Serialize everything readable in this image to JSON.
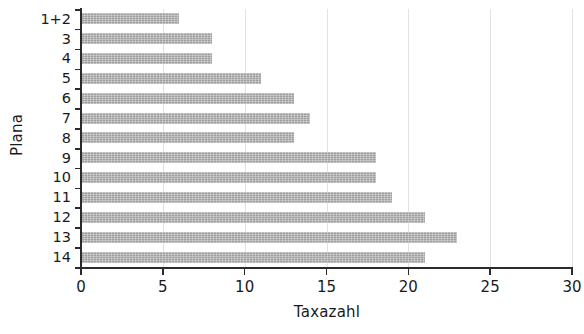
{
  "chart_data": {
    "type": "bar",
    "orientation": "horizontal",
    "title": "",
    "xlabel": "Taxazahl",
    "ylabel": "Plana",
    "categories": [
      "1+2",
      "3",
      "4",
      "5",
      "6",
      "7",
      "8",
      "9",
      "10",
      "11",
      "12",
      "13",
      "14"
    ],
    "values": [
      6,
      8,
      8,
      11,
      13,
      14,
      13,
      18,
      18,
      19,
      21,
      23,
      21
    ],
    "xlim": [
      0,
      30
    ],
    "xticks": [
      0,
      5,
      10,
      15,
      20,
      25,
      30
    ],
    "xtick_labels": [
      "0",
      "5",
      "10",
      "15",
      "20",
      "25",
      "30"
    ],
    "grid": "vertical-light",
    "legend": null,
    "bar_color": "#a8a8a8",
    "axis_color": "#2b2b2b",
    "background_color": "#ffffff"
  }
}
